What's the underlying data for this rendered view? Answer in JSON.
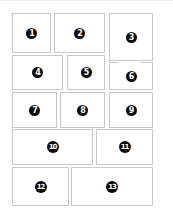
{
  "diagram": {
    "type": "panel-layout",
    "panels": [
      {
        "number": "1",
        "label": "1"
      },
      {
        "number": "2",
        "label": "2"
      },
      {
        "number": "3",
        "label": "3"
      },
      {
        "number": "4",
        "label": "4"
      },
      {
        "number": "5",
        "label": "5"
      },
      {
        "number": "6",
        "label": "6"
      },
      {
        "number": "7",
        "label": "7"
      },
      {
        "number": "8",
        "label": "8"
      },
      {
        "number": "9",
        "label": "9"
      },
      {
        "number": "10",
        "label": "10"
      },
      {
        "number": "11",
        "label": "11"
      },
      {
        "number": "12",
        "label": "12"
      },
      {
        "number": "13",
        "label": "13"
      }
    ],
    "colors": {
      "border": "#c8c8c8",
      "badge_fill": "#0a0a0a",
      "badge_text": "#ffffff",
      "background": "#ffffff"
    }
  }
}
